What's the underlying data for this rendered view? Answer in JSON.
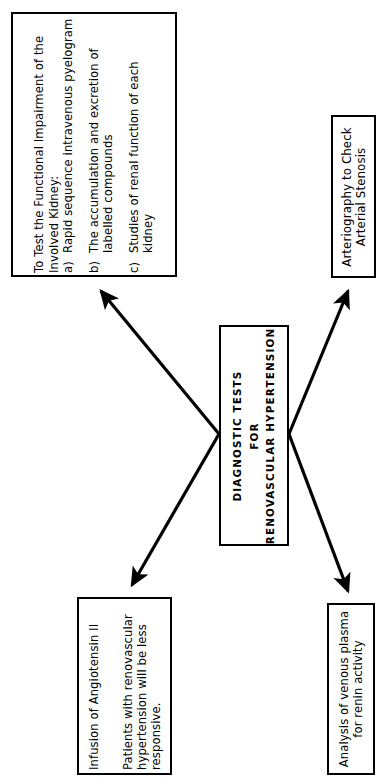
{
  "diagram": {
    "title": "Diagnostic Tests for Renovascular Hypertension",
    "orientation": "rotated-90-ccw",
    "line_color": "#000000",
    "box_border_color": "#000000",
    "background_color": "#ffffff",
    "center": {
      "name": "diagnostic-tests-center",
      "line1": "DIAGNOSTIC TESTS",
      "line2": "FOR",
      "line3": "RENOVASCULAR HYPERTENSION"
    },
    "nodes": [
      {
        "id": "functional-impairment",
        "heading1": "To Test the Functional Impairment of the",
        "heading2": "Involved Kidney:",
        "items": [
          {
            "marker": "a)",
            "line1": "Rapid sequence intravenous pyelogram",
            "line2": ""
          },
          {
            "marker": "b)",
            "line1": "The accumulation and excretion of",
            "line2": "labelled compounds"
          },
          {
            "marker": "c)",
            "line1": "Studies of renal function of each",
            "line2": "kidney"
          }
        ]
      },
      {
        "id": "arteriography",
        "line1": "Arteriography to Check",
        "line2": "Arterial Stenosis"
      },
      {
        "id": "angiotensin",
        "line1": "Infusion of Angiotensin  II",
        "line2": "Patients with renovascular",
        "line3": "hypertension will be less",
        "line4": "responsive."
      },
      {
        "id": "renin",
        "line1": "Analysis of venous plasma",
        "line2": "for renin activity"
      }
    ],
    "edges": [
      {
        "id": "edge-center-to-functional-impairment",
        "from": "center",
        "to": "functional-impairment"
      },
      {
        "id": "edge-center-to-arteriography",
        "from": "center",
        "to": "arteriography"
      },
      {
        "id": "edge-center-to-angiotensin",
        "from": "center",
        "to": "angiotensin"
      },
      {
        "id": "edge-center-to-renin",
        "from": "center",
        "to": "renin"
      }
    ]
  }
}
